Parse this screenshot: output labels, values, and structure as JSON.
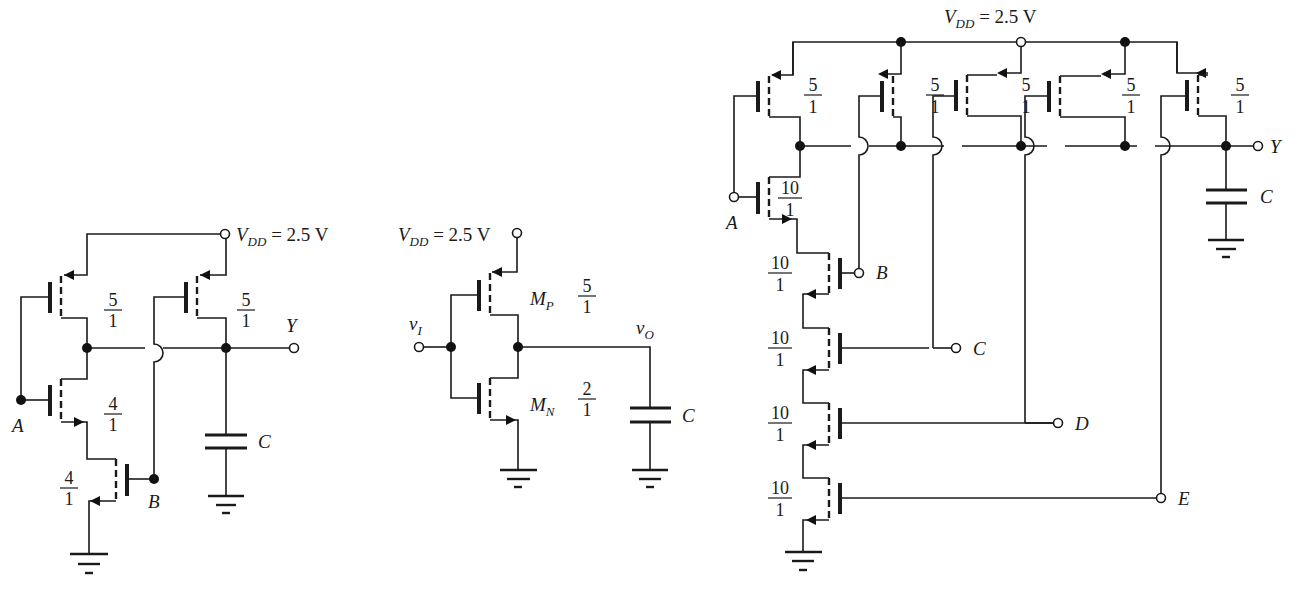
{
  "figure": {
    "type": "CMOS logic gate schematics",
    "circuits": [
      {
        "id": "left",
        "name": "Two-input NOR-style pull-down (NAND) gate",
        "supply": {
          "label": "V",
          "subscript": "DD",
          "value": " = 2.5 V"
        },
        "output": {
          "label": "Y"
        },
        "capacitor": {
          "label": "C"
        },
        "inputs": [
          "A",
          "B"
        ],
        "transistors": [
          {
            "type": "PMOS",
            "gate": "A",
            "ratio": {
              "num": "5",
              "den": "1"
            }
          },
          {
            "type": "PMOS",
            "gate": "B",
            "ratio": {
              "num": "5",
              "den": "1"
            }
          },
          {
            "type": "NMOS",
            "gate": "A",
            "ratio": {
              "num": "4",
              "den": "1"
            }
          },
          {
            "type": "NMOS",
            "gate": "B",
            "ratio": {
              "num": "4",
              "den": "1"
            }
          }
        ]
      },
      {
        "id": "middle",
        "name": "CMOS inverter",
        "supply": {
          "label": "V",
          "subscript": "DD",
          "value": " = 2.5 V"
        },
        "input": {
          "label": "v",
          "subscript": "I"
        },
        "output": {
          "label": "v",
          "subscript": "O"
        },
        "capacitor": {
          "label": "C"
        },
        "transistors": [
          {
            "type": "PMOS",
            "name": "M",
            "subscript": "P",
            "ratio": {
              "num": "5",
              "den": "1"
            }
          },
          {
            "type": "NMOS",
            "name": "M",
            "subscript": "N",
            "ratio": {
              "num": "2",
              "den": "1"
            }
          }
        ]
      },
      {
        "id": "right",
        "name": "Five-input NAND gate",
        "supply": {
          "label": "V",
          "subscript": "DD",
          "value": " = 2.5 V"
        },
        "output": {
          "label": "Y"
        },
        "capacitor": {
          "label": "C"
        },
        "inputs": [
          "A",
          "B",
          "C",
          "D",
          "E"
        ],
        "pmos_ratio": {
          "num": "5",
          "den": "1"
        },
        "nmos_ratio": {
          "num": "10",
          "den": "1"
        },
        "pmos_count": 5,
        "nmos_count": 5
      }
    ]
  }
}
